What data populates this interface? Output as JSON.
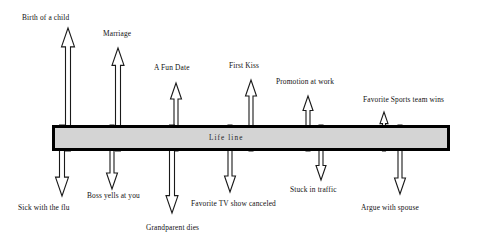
{
  "diagram": {
    "lifeline": {
      "label": "Life line",
      "label_x": 209,
      "label_y": 134,
      "bar": {
        "x": 52,
        "y": 125,
        "width": 398,
        "height": 26,
        "fill": "#d4d4d4",
        "stroke": "#000000",
        "stroke_width": 3
      }
    },
    "positive_events": [
      {
        "label": "Birth of a child",
        "arrow_x": 68,
        "arrow_top": 28,
        "head_w": 13,
        "shaft_w": 5,
        "label_x": 22,
        "label_y": 14
      },
      {
        "label": "Marriage",
        "arrow_x": 118,
        "arrow_top": 48,
        "head_w": 12,
        "shaft_w": 5,
        "label_x": 103,
        "label_y": 30
      },
      {
        "label": "A Fun Date",
        "arrow_x": 176,
        "arrow_top": 83,
        "head_w": 11,
        "shaft_w": 4,
        "label_x": 154,
        "label_y": 64
      },
      {
        "label": "First Kiss",
        "arrow_x": 251,
        "arrow_top": 80,
        "head_w": 11,
        "shaft_w": 4,
        "label_x": 229,
        "label_y": 62
      },
      {
        "label": "Promotion at work",
        "arrow_x": 308,
        "arrow_top": 96,
        "head_w": 10,
        "shaft_w": 4,
        "label_x": 276,
        "label_y": 78
      },
      {
        "label": "Favorite Sports team wins",
        "arrow_x": 384,
        "arrow_top": 112,
        "head_w": 8,
        "shaft_w": 3,
        "label_x": 363,
        "label_y": 96
      }
    ],
    "negative_events": [
      {
        "label": "Sick with the flu",
        "arrow_x": 62,
        "arrow_bottom": 196,
        "head_w": 13,
        "shaft_w": 5,
        "label_x": 18,
        "label_y": 204
      },
      {
        "label": "Boss yells at you",
        "arrow_x": 112,
        "arrow_bottom": 189,
        "head_w": 11,
        "shaft_w": 4,
        "label_x": 87,
        "label_y": 192
      },
      {
        "label": "Grandparent dies",
        "arrow_x": 172,
        "arrow_bottom": 213,
        "head_w": 12,
        "shaft_w": 5,
        "label_x": 146,
        "label_y": 224
      },
      {
        "label": "Favorite TV show canceled",
        "arrow_x": 230,
        "arrow_bottom": 192,
        "head_w": 11,
        "shaft_w": 4,
        "label_x": 191,
        "label_y": 200
      },
      {
        "label": "Stuck in traffic",
        "arrow_x": 321,
        "arrow_bottom": 180,
        "head_w": 10,
        "shaft_w": 4,
        "label_x": 290,
        "label_y": 186
      },
      {
        "label": "Argue with spouse",
        "arrow_x": 400,
        "arrow_bottom": 194,
        "head_w": 11,
        "shaft_w": 4,
        "label_x": 361,
        "label_y": 204
      }
    ]
  }
}
